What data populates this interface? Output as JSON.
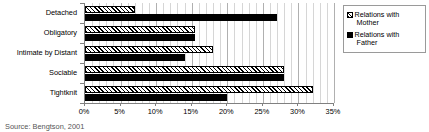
{
  "chart_data": {
    "type": "bar",
    "orientation": "horizontal",
    "title": "",
    "xlabel": "",
    "ylabel": "",
    "categories": [
      "Detached",
      "Obligatory",
      "Intimate by Distant",
      "Sociable",
      "Tightknit"
    ],
    "series": [
      {
        "name": "Relations with Mother",
        "pattern": "diagonal-hatch",
        "color": "#ffffff",
        "values": [
          7,
          15.5,
          18,
          28,
          32
        ]
      },
      {
        "name": "Relations with Father",
        "pattern": "solid",
        "color": "#000000",
        "values": [
          27,
          15.5,
          14,
          28,
          20
        ]
      }
    ],
    "xlim": [
      0,
      35
    ],
    "xticks": [
      0,
      5,
      10,
      15,
      20,
      25,
      30,
      35
    ],
    "xtick_labels": [
      "0%",
      "5%",
      "10%",
      "15%",
      "20%",
      "25%",
      "30%",
      "35%"
    ],
    "grid": true,
    "grid_axis": "x",
    "legend_position": "right"
  },
  "legend": {
    "items": [
      {
        "label_line1": "Relations with",
        "label_line2": "Mother"
      },
      {
        "label_line1": "Relations with",
        "label_line2": "Father"
      }
    ]
  },
  "footer": {
    "source": "Source: Bengtson, 2001"
  }
}
